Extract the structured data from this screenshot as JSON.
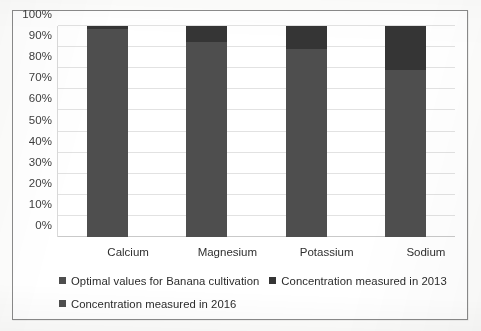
{
  "chart_data": {
    "type": "bar",
    "subtype": "stacked-column",
    "title": "",
    "xlabel": "",
    "ylabel": "",
    "categories": [
      "Calcium",
      "Magnesium",
      "Potassium",
      "Sodium"
    ],
    "ylim": [
      0,
      100
    ],
    "y_tick_labels": [
      "0%",
      "10%",
      "20%",
      "30%",
      "40%",
      "50%",
      "60%",
      "70%",
      "80%",
      "90%",
      "100%"
    ],
    "y_tick_values": [
      0,
      10,
      20,
      30,
      40,
      50,
      60,
      70,
      80,
      90,
      100
    ],
    "grid": true,
    "legend_position": "bottom",
    "series": [
      {
        "name": "Optimal values for Banana cultivation",
        "color": "#4e4e4e",
        "values": [
          98.5,
          92.5,
          89.0,
          79.0
        ]
      },
      {
        "name": "Concentration measured in 2013",
        "color": "#353535",
        "values": [
          1.5,
          7.5,
          11.0,
          21.0
        ]
      },
      {
        "name": "Concentration measured in 2016",
        "color": "#353535",
        "values": [
          0,
          0,
          0,
          0
        ]
      }
    ],
    "stack_tops": [
      100,
      100,
      100,
      100
    ]
  },
  "legend": {
    "rows": [
      [
        {
          "label": "Optimal values for Banana cultivation",
          "color": "#4e4e4e"
        },
        {
          "label": "Concentration measured in 2013",
          "color": "#353535"
        }
      ],
      [
        {
          "label": "Concentration measured in 2016",
          "color": "#4e4e4e"
        }
      ]
    ]
  }
}
